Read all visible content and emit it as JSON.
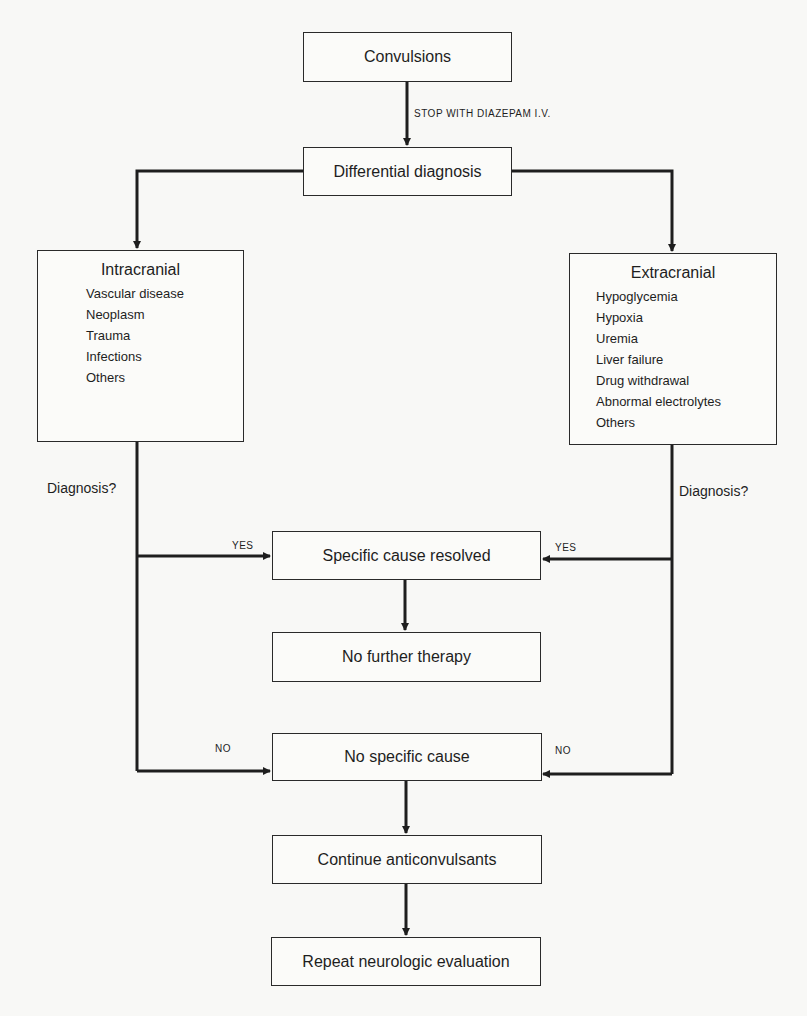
{
  "nodes": {
    "convulsions": "Convulsions",
    "differential": "Differential diagnosis",
    "intracranial": {
      "title": "Intracranial",
      "items": [
        "Vascular disease",
        "Neoplasm",
        "Trauma",
        "Infections",
        "Others"
      ]
    },
    "extracranial": {
      "title": "Extracranial",
      "items": [
        "Hypoglycemia",
        "Hypoxia",
        "Uremia",
        "Liver failure",
        "Drug withdrawal",
        "Abnormal electrolytes",
        "Others"
      ]
    },
    "specific_resolved": "Specific cause resolved",
    "no_further": "No further therapy",
    "no_specific": "No specific cause",
    "continue": "Continue anticonvulsants",
    "repeat": "Repeat neurologic evaluation"
  },
  "labels": {
    "stop": "STOP WITH DIAZEPAM I.V.",
    "diagnosis_left": "Diagnosis?",
    "diagnosis_right": "Diagnosis?",
    "yes_left": "YES",
    "yes_right": "YES",
    "no_left": "NO",
    "no_right": "NO"
  }
}
